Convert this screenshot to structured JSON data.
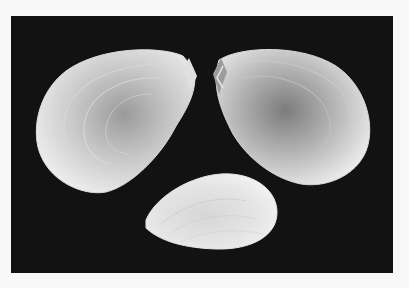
{
  "image": {
    "subject": "three white bivalve seashells on black background",
    "colors": {
      "page_background": "#f8f8f8",
      "photo_background": "#121212",
      "shell_light": "#f2f2f2",
      "shell_mid": "#bdbdbd",
      "shell_dark": "#7a7a7a"
    },
    "shells": [
      {
        "name": "left-valve",
        "position": "top-left"
      },
      {
        "name": "right-valve",
        "position": "top-right"
      },
      {
        "name": "small-shell",
        "position": "bottom-center"
      }
    ]
  }
}
